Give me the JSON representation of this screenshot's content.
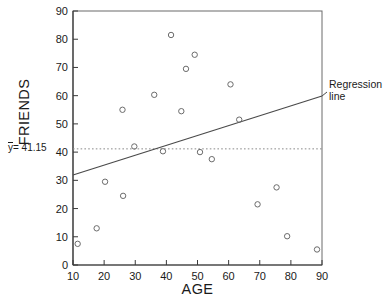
{
  "chart_data": {
    "type": "scatter",
    "title": "",
    "xlabel": "AGE",
    "ylabel": "FRIENDS",
    "xlim": [
      10,
      90
    ],
    "ylim": [
      0,
      90
    ],
    "xticks": [
      10,
      20,
      30,
      40,
      50,
      60,
      70,
      80,
      90
    ],
    "yticks": [
      0,
      10,
      20,
      30,
      40,
      50,
      60,
      70,
      80,
      90
    ],
    "grid": false,
    "legend": null,
    "marker": "open-circle",
    "points": [
      {
        "x": 11.5,
        "y": 7.5
      },
      {
        "x": 17.6,
        "y": 13.0
      },
      {
        "x": 20.3,
        "y": 29.5
      },
      {
        "x": 25.9,
        "y": 55.0
      },
      {
        "x": 26.1,
        "y": 24.5
      },
      {
        "x": 29.7,
        "y": 42.0
      },
      {
        "x": 36.1,
        "y": 60.3
      },
      {
        "x": 38.9,
        "y": 40.3
      },
      {
        "x": 41.5,
        "y": 81.5
      },
      {
        "x": 44.8,
        "y": 54.5
      },
      {
        "x": 46.3,
        "y": 69.5
      },
      {
        "x": 49.1,
        "y": 74.5
      },
      {
        "x": 50.8,
        "y": 40.0
      },
      {
        "x": 54.6,
        "y": 37.5
      },
      {
        "x": 60.6,
        "y": 64.0
      },
      {
        "x": 63.4,
        "y": 51.5
      },
      {
        "x": 69.3,
        "y": 21.5
      },
      {
        "x": 75.4,
        "y": 27.5
      },
      {
        "x": 78.8,
        "y": 10.2
      },
      {
        "x": 88.4,
        "y": 5.5
      }
    ],
    "mean_line": {
      "label": "= 41.15",
      "symbol": "y",
      "value": 41.15,
      "style": "dotted"
    },
    "regression_line": {
      "label_line1": "Regression",
      "label_line2": "line",
      "x_start": 10,
      "y_start": 31.9,
      "x_end": 90,
      "y_end": 59.9,
      "style": "solid"
    },
    "colors": {
      "axis": "#4a4a4a",
      "marker": "#6b6b6b",
      "regression": "#4a4a4a",
      "mean": "#8a8a8a",
      "text": "#1a1a1a"
    }
  }
}
